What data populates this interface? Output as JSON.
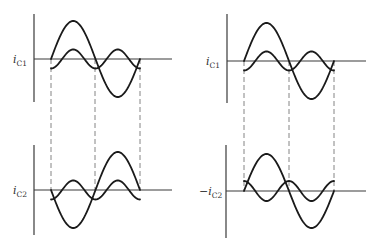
{
  "figure": {
    "panels": [
      {
        "id": "top-left",
        "label_prefix": "i",
        "label_sub": "C1",
        "label_sign": "",
        "axis": {
          "x0": 34,
          "yTop": 14,
          "yBot": 102,
          "yAxis": 59,
          "xEnd": 172
        },
        "period": {
          "x0": 51,
          "x1": 140
        },
        "fundamental": {
          "amp": 38,
          "phase_sign": 1
        },
        "harmonic": {
          "amp": 9.5,
          "offset": 0,
          "shape": "neg-cos-2"
        },
        "dashes": [
          51,
          95,
          140
        ]
      },
      {
        "id": "bottom-left",
        "label_prefix": "i",
        "label_sub": "C2",
        "label_sign": "",
        "axis": {
          "x0": 34,
          "yTop": 145,
          "yBot": 235,
          "yAxis": 190,
          "xEnd": 172
        },
        "period": {
          "x0": 51,
          "x1": 140
        },
        "fundamental": {
          "amp": 38,
          "phase_sign": -1
        },
        "harmonic": {
          "amp": 9.5,
          "offset": 0,
          "shape": "neg-cos-2"
        },
        "dashes": [
          51,
          95,
          140
        ]
      },
      {
        "id": "top-right",
        "label_prefix": "i",
        "label_sub": "C1",
        "label_sign": "",
        "axis": {
          "x0": 227,
          "yTop": 14,
          "yBot": 103,
          "yAxis": 61,
          "xEnd": 366
        },
        "period": {
          "x0": 244,
          "x1": 334
        },
        "fundamental": {
          "amp": 38,
          "phase_sign": 1
        },
        "harmonic": {
          "amp": 9.5,
          "offset": 0,
          "shape": "neg-cos-2"
        },
        "dashes": [
          244,
          289,
          334
        ]
      },
      {
        "id": "bottom-right",
        "label_prefix": "i",
        "label_sub": "C2",
        "label_sign": "−",
        "axis": {
          "x0": 226,
          "yTop": 145,
          "yBot": 238,
          "yAxis": 191,
          "xEnd": 366
        },
        "period": {
          "x0": 244,
          "x1": 334
        },
        "fundamental": {
          "amp": 37,
          "phase_sign": 1
        },
        "harmonic": {
          "amp": 10,
          "offset": 0,
          "shape": "cos-2"
        },
        "dashes": [
          244,
          289,
          334
        ]
      }
    ],
    "dash_span": [
      {
        "x": 51,
        "y0": 59,
        "y1": 190
      },
      {
        "x": 95,
        "y0": 59,
        "y1": 190
      },
      {
        "x": 140,
        "y0": 59,
        "y1": 190
      },
      {
        "x": 244,
        "y0": 61,
        "y1": 191
      },
      {
        "x": 289,
        "y0": 61,
        "y1": 191
      },
      {
        "x": 334,
        "y0": 61,
        "y1": 191
      }
    ],
    "labels": [
      {
        "text": "i",
        "sub": "C1",
        "sign": "",
        "x": 13,
        "y": 63
      },
      {
        "text": "i",
        "sub": "C2",
        "sign": "",
        "x": 13,
        "y": 194
      },
      {
        "text": "i",
        "sub": "C1",
        "sign": "",
        "x": 206,
        "y": 65
      },
      {
        "text": "i",
        "sub": "C2",
        "sign": "−",
        "x": 199,
        "y": 195
      }
    ]
  }
}
